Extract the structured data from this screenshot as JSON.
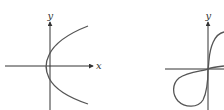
{
  "figures": [
    {
      "id": "left",
      "description": "Sideways parabola opening to the right, vertex slightly left of the y-axis",
      "axis_labels": {
        "x": "x",
        "y": "y"
      },
      "curve_type": "parabola (x = y^2 form)",
      "stroke_color": "#555555"
    },
    {
      "id": "right",
      "description": "Figure-eight / lemniscate-like curve through origin with loops in quadrants I and III (right side cropped)",
      "axis_labels": {
        "y": "y"
      },
      "curve_type": "lemniscate-like loop",
      "stroke_color": "#555555"
    }
  ],
  "colors": {
    "axis": "#333333",
    "curve": "#555555",
    "background": "#ffffff"
  }
}
